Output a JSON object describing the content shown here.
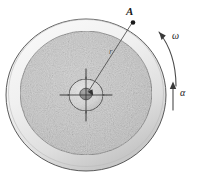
{
  "figure": {
    "labels": {
      "point_a": "A",
      "radius": "r",
      "angular_velocity": "ω",
      "angular_acceleration": "α"
    },
    "geometry": {
      "center_x": 86,
      "center_y": 95,
      "outer_rim_radius": 80,
      "inner_disk_radius": 66,
      "hub_outer_radius": 17,
      "hub_inner_radius": 6,
      "crosshair_half_length": 26,
      "point_a_x": 133,
      "point_a_y": 22
    },
    "colors": {
      "outline": "#3c3c3c",
      "rim_light": "#f2f2f2",
      "rim_shadow": "#c9c9c9",
      "disk_fill": "#c6c6c6",
      "hub_fill": "#d8d8d8",
      "hub_core": "#8f8f8f",
      "leader_line": "#4a4a4a",
      "arrow": "#4a4a4a",
      "background": "#ffffff"
    },
    "annotations": {
      "omega_arrow": "curved-ccw-arrow",
      "alpha_arrow": "straight-up-arrow",
      "radius_leader": "line-from-center-to-point-a"
    }
  }
}
